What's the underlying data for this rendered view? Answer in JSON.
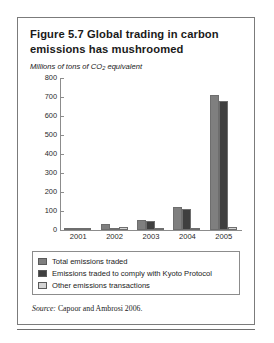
{
  "figure": {
    "title": "Figure 5.7  Global trading in carbon emissions has mushroomed",
    "axis_note_prefix": "Millions of tons of CO",
    "axis_note_sub": "2",
    "axis_note_suffix": " equivalent",
    "source_word": "Source:",
    "source_text": " Capoor and Ambrosi 2006."
  },
  "legend": {
    "items": [
      {
        "label": "Total emissions traded",
        "color": "#7f7f7f"
      },
      {
        "label": "Emissions traded to comply with Kyoto Protocol",
        "color": "#3f3f3f"
      },
      {
        "label": "Other emissions transactions",
        "color": "#d4d4d4"
      }
    ]
  },
  "chart_data": {
    "type": "bar",
    "title": "Figure 5.7  Global trading in carbon emissions has mushroomed",
    "subtitle": "Millions of tons of CO2 equivalent",
    "xlabel": "",
    "ylabel": "Millions of tons of CO2 equivalent",
    "ylim": [
      0,
      800
    ],
    "yticks": [
      0,
      100,
      200,
      300,
      400,
      500,
      600,
      700,
      800
    ],
    "ytick_labels": [
      "0",
      "100",
      "200",
      "300",
      "400",
      "500",
      "600",
      "700",
      "800"
    ],
    "grid": false,
    "legend_position": "below-plot",
    "categories": [
      "2001",
      "2002",
      "2003",
      "2004",
      "2005"
    ],
    "series": [
      {
        "name": "Total emissions traded",
        "color": "#7f7f7f",
        "values": [
          10,
          30,
          55,
          120,
          710
        ]
      },
      {
        "name": "Emissions traded to comply with Kyoto Protocol",
        "color": "#3f3f3f",
        "values": [
          2,
          12,
          45,
          110,
          680
        ]
      },
      {
        "name": "Other emissions transactions",
        "color": "#d4d4d4",
        "values": [
          9,
          16,
          8,
          10,
          16
        ]
      }
    ],
    "source": "Source: Capoor and Ambrosi 2006."
  }
}
